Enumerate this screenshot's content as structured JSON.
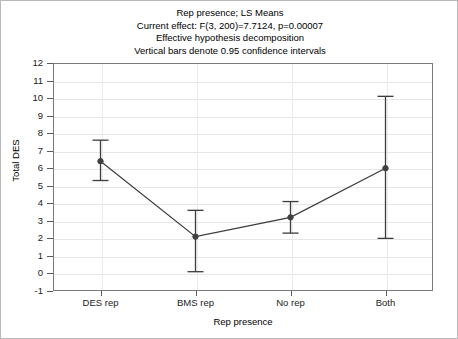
{
  "title": {
    "line1": "Rep presence; LS Means",
    "line2": "Current effect: F(3, 200)=7.7124, p=0.00007",
    "line3": "Effective hypothesis decomposition",
    "line4": "Vertical bars denote 0.95 confidence intervals"
  },
  "chart_data": {
    "type": "line",
    "title": "Rep presence; LS Means",
    "subtitle": "Current effect: F(3, 200)=7.7124, p=0.00007",
    "note1": "Effective hypothesis decomposition",
    "note2": "Vertical bars denote 0.95 confidence intervals",
    "xlabel": "Rep presence",
    "ylabel": "Total DES",
    "categories": [
      "DES rep",
      "BMS rep",
      "No rep",
      "Both"
    ],
    "values": [
      6.4,
      2.1,
      3.2,
      6.0
    ],
    "error_low": [
      5.3,
      0.1,
      2.3,
      2.0
    ],
    "error_high": [
      7.6,
      3.6,
      4.1,
      10.1
    ],
    "ylim": [
      -1,
      12
    ],
    "yticks": [
      -1,
      0,
      1,
      2,
      3,
      4,
      5,
      6,
      7,
      8,
      9,
      10,
      11,
      12
    ],
    "ytick_labels": [
      "-1",
      "0",
      "1",
      "2",
      "3",
      "4",
      "5",
      "6",
      "7",
      "8",
      "9",
      "10",
      "11",
      "12"
    ],
    "grid": true,
    "legend": "none",
    "series_color": "#3c3c3c",
    "marker": "filled-circle",
    "errorbar_cap": true
  },
  "colors": {
    "line": "#3c3c3c",
    "marker": "#404040",
    "grid": "#e6e6e6",
    "axis": "#7a7a7a",
    "text": "#000000",
    "background": "#ffffff"
  }
}
